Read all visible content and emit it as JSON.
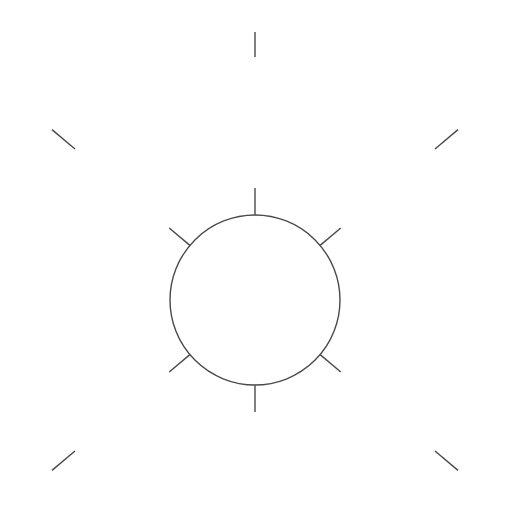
{
  "figure": {
    "name": "radial-burst-diagram",
    "width": 510,
    "height": 516,
    "background_color": "#ffffff",
    "stroke_color": "#4a4a4a",
    "stroke_width": 1.4,
    "center": {
      "x": 255,
      "y": 300
    },
    "circle": {
      "name": "center-circle",
      "cx": 255,
      "cy": 300,
      "r": 85
    },
    "inner_spikes": [
      {
        "name": "spike-top",
        "angle_deg": 90,
        "inner_r": 85,
        "outer_r": 112
      },
      {
        "name": "spike-upper-right",
        "angle_deg": 40,
        "inner_r": 85,
        "outer_r": 112
      },
      {
        "name": "spike-lower-right",
        "angle_deg": -40,
        "inner_r": 85,
        "outer_r": 112
      },
      {
        "name": "spike-bottom",
        "angle_deg": -90,
        "inner_r": 85,
        "outer_r": 112
      },
      {
        "name": "spike-lower-left",
        "angle_deg": 220,
        "inner_r": 85,
        "outer_r": 112
      },
      {
        "name": "spike-upper-left",
        "angle_deg": 140,
        "inner_r": 85,
        "outer_r": 112
      }
    ],
    "outer_rays": [
      {
        "name": "outer-ray-top",
        "angle_deg": 90,
        "inner_r": 243,
        "outer_r": 268
      },
      {
        "name": "outer-ray-upper-left",
        "angle_deg": 140,
        "inner_r": 235,
        "outer_r": 265
      },
      {
        "name": "outer-ray-upper-right",
        "angle_deg": 40,
        "inner_r": 235,
        "outer_r": 265
      },
      {
        "name": "outer-ray-lower-left",
        "angle_deg": 220,
        "inner_r": 235,
        "outer_r": 265
      },
      {
        "name": "outer-ray-lower-right",
        "angle_deg": -40,
        "inner_r": 235,
        "outer_r": 265
      }
    ]
  }
}
